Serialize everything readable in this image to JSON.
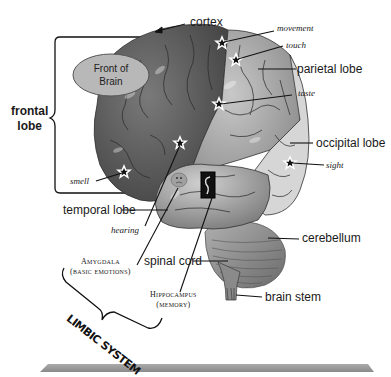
{
  "diagram": {
    "oval": {
      "text_line1": "Front of",
      "text_line2": "Brain",
      "fill": "#b8b8b8"
    },
    "labels": {
      "cortex": "cortex",
      "frontal_lobe_line1": "frontal",
      "frontal_lobe_line2": "lobe",
      "parietal_lobe": "parietal lobe",
      "occipital_lobe": "occipital lobe",
      "temporal_lobe": "temporal lobe",
      "cerebellum": "cerebellum",
      "spinal_cord": "spinal cord",
      "brain_stem": "brain stem"
    },
    "functions": {
      "movement": "movement",
      "touch": "touch",
      "taste": "taste",
      "sight": "sight",
      "smell": "smell",
      "hearing": "hearing"
    },
    "limbic": {
      "amygdala_line1": "Amygdala",
      "amygdala_line2": "(basic emotions)",
      "hippocampus_line1": "Hippocampus",
      "hippocampus_line2": "(memory)",
      "system_label": "LIMBIC SYSTEM"
    },
    "colors": {
      "brain_dark": "#5a5a5a",
      "brain_light": "#a9a9a9",
      "occipital": "#d4d4d4",
      "cerebellum": "#8c8c8c",
      "base_platform": "#9a9a9a"
    }
  }
}
